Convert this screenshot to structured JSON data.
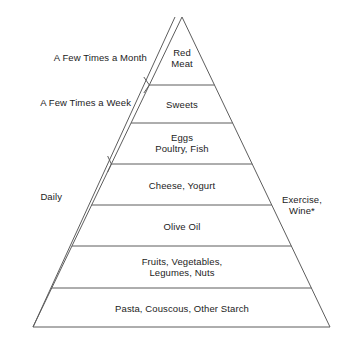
{
  "diagram": {
    "colors": {
      "background": "#ffffff",
      "stroke": "#5d5d5d",
      "text": "#1c1c1c"
    },
    "geometry": {
      "apex": [
        182,
        17
      ],
      "base_left": [
        33,
        327
      ],
      "base_right": [
        330,
        327
      ],
      "band_apex": [
        175,
        17
      ],
      "band_offset": 12,
      "divider_y": [
        85,
        123,
        164,
        205,
        246,
        288
      ],
      "tick_y": [
        85,
        164
      ]
    }
  },
  "tiers": [
    {
      "label": "Red\nMeat",
      "cx": 182,
      "cy": 58
    },
    {
      "label": "Sweets",
      "cx": 182,
      "cy": 104
    },
    {
      "label": "Eggs\nPoultry, Fish",
      "cx": 182,
      "cy": 143
    },
    {
      "label": "Cheese, Yogurt",
      "cx": 182,
      "cy": 185
    },
    {
      "label": "Olive Oil",
      "cx": 182,
      "cy": 226
    },
    {
      "label": "Fruits, Vegetables,\nLegumes, Nuts",
      "cx": 182,
      "cy": 267
    },
    {
      "label": "Pasta, Couscous, Other Starch",
      "cx": 182,
      "cy": 308
    }
  ],
  "frequency_labels": [
    {
      "text": "A Few Times a Month",
      "x": 147,
      "y": 57
    },
    {
      "text": "A Few Times a Week",
      "x": 131,
      "y": 102
    },
    {
      "text": "Daily",
      "x": 62,
      "y": 196
    }
  ],
  "side_notes": [
    {
      "text": "Exercise,\nWine*",
      "x": 282,
      "y": 205
    }
  ]
}
